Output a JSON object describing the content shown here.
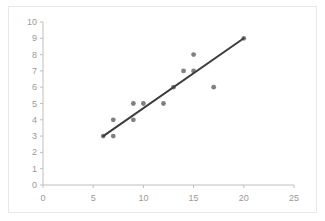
{
  "chart_data": {
    "type": "scatter",
    "title": "",
    "subtitle": "",
    "xlabel": "",
    "ylabel": "",
    "xlim": [
      0,
      25
    ],
    "ylim": [
      0,
      10
    ],
    "xticks": [
      0,
      5,
      10,
      15,
      20,
      25
    ],
    "yticks": [
      0,
      1,
      2,
      3,
      4,
      5,
      6,
      7,
      8,
      9,
      10
    ],
    "xtick_labels": [
      "0",
      "5",
      "10",
      "15",
      "20",
      "25"
    ],
    "ytick_labels": [
      "0",
      "1",
      "2",
      "3",
      "4",
      "5",
      "6",
      "7",
      "8",
      "9",
      "10"
    ],
    "grid": false,
    "legend": false,
    "legend_position": "none",
    "annotations": [],
    "marker_color": "#808080",
    "marker_shape": "circle",
    "axis_color": "#bfbfbf",
    "tick_label_color": "#9a9a9a",
    "plot_background": "#ffffff",
    "border_color": "#e8e8e8",
    "series": [
      {
        "name": "data",
        "type": "scatter",
        "color": "#808080",
        "points": [
          {
            "x": 6,
            "y": 3
          },
          {
            "x": 7,
            "y": 3
          },
          {
            "x": 7,
            "y": 4
          },
          {
            "x": 9,
            "y": 4
          },
          {
            "x": 9,
            "y": 5
          },
          {
            "x": 10,
            "y": 5
          },
          {
            "x": 12,
            "y": 5
          },
          {
            "x": 13,
            "y": 6
          },
          {
            "x": 14,
            "y": 7
          },
          {
            "x": 15,
            "y": 7
          },
          {
            "x": 15,
            "y": 8
          },
          {
            "x": 17,
            "y": 6
          },
          {
            "x": 20,
            "y": 9
          }
        ]
      },
      {
        "name": "trendline",
        "type": "line",
        "color": "#3d3d3d",
        "points": [
          {
            "x": 6,
            "y": 3
          },
          {
            "x": 20,
            "y": 9
          }
        ]
      }
    ]
  }
}
